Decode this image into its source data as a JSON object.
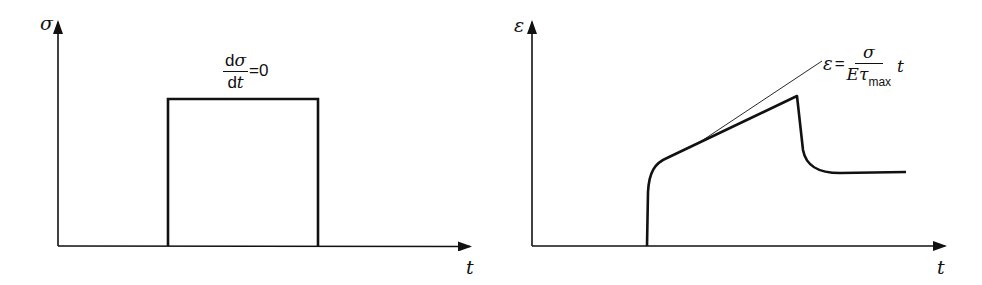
{
  "diagram": {
    "left_panel": {
      "y_axis_label": "σ",
      "x_axis_label": "t",
      "annotation": {
        "numerator": "dσ",
        "numerator_d": "d",
        "numerator_sym": "σ",
        "denominator_d": "d",
        "denominator_sym": "t",
        "rhs": "=0"
      },
      "curve": "rectangular stress pulse (constant stress)"
    },
    "right_panel": {
      "y_axis_label": "ε",
      "x_axis_label": "t",
      "annotation": {
        "lhs": "ε",
        "eq": "=",
        "numerator": "σ",
        "denominator_E": "E",
        "denominator_tau": "τ",
        "denominator_sub": "max",
        "trailing": "t"
      },
      "curve": "creep strain response with recovery"
    },
    "colors": {
      "line": "#111111",
      "background": "#ffffff"
    }
  }
}
